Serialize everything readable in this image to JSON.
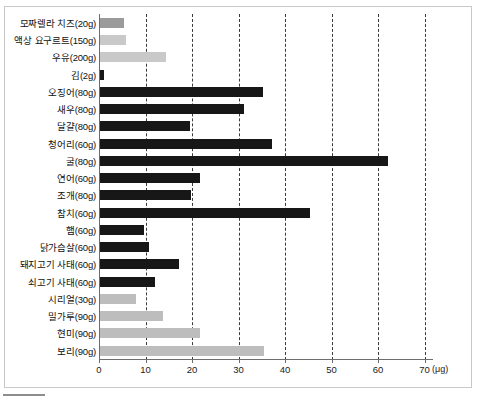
{
  "chart_data": {
    "type": "bar",
    "orientation": "horizontal",
    "title": "",
    "xlabel": "(μg)",
    "ylabel": "",
    "xlim": [
      0,
      70
    ],
    "xticks": [
      0,
      10,
      20,
      30,
      40,
      50,
      60,
      70
    ],
    "grid": true,
    "legend": "none",
    "unit": "(μg)",
    "colors": {
      "dark": "#171717",
      "mid": "#9b9b9b",
      "light": "#c9c9c9",
      "lightgray": "#bdbdbd",
      "axis": "#6d6d6d",
      "gridline": "#3a3a3a",
      "frame": "#c9c9c9"
    },
    "categories": [
      "모짜렐라 치즈(20g)",
      "액상 요구르트(150g)",
      "우유(200g)",
      "김(2g)",
      "오징어(80g)",
      "새우(80g)",
      "달걀(80g)",
      "청어리(60g)",
      "굴(80g)",
      "연어(60g)",
      "조개(80g)",
      "참치(60g)",
      "햄(60g)",
      "닭가슴살(60g)",
      "돼지고기 사태(60g)",
      "쇠고기 사태(60g)",
      "시리얼(30g)",
      "밀가루(90g)",
      "현미(90g)",
      "보리(90g)"
    ],
    "values": [
      5.2,
      5.6,
      14.3,
      0.8,
      35.0,
      30.9,
      19.4,
      36.9,
      62.0,
      21.5,
      19.6,
      45.2,
      9.4,
      10.5,
      17.0,
      11.9,
      7.7,
      13.5,
      21.5,
      35.3
    ],
    "bar_colors": [
      "mid",
      "light",
      "light",
      "dark",
      "dark",
      "dark",
      "dark",
      "dark",
      "dark",
      "dark",
      "dark",
      "dark",
      "dark",
      "dark",
      "dark",
      "dark",
      "lightgray",
      "lightgray",
      "lightgray",
      "lightgray"
    ]
  },
  "caption": {
    "text": ""
  }
}
